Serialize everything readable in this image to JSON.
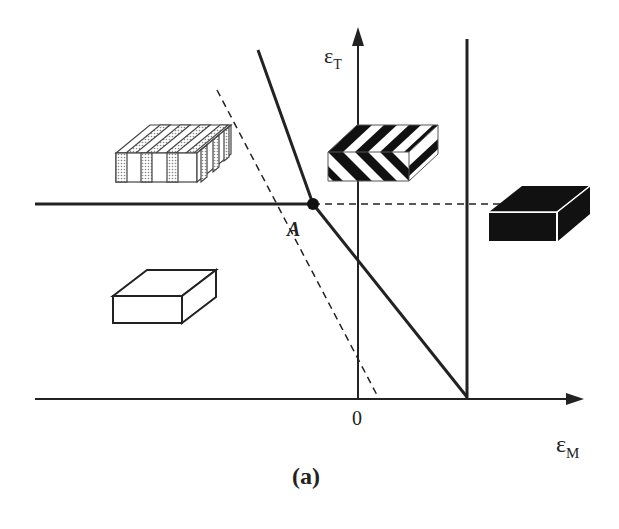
{
  "diagram": {
    "caption": "(a)",
    "axes": {
      "x_label_main": "ε",
      "x_label_sub": "M",
      "y_label_main": "ε",
      "y_label_sub": "T",
      "origin_label": "0"
    },
    "point": {
      "label": "A"
    },
    "blocks": [
      {
        "name": "striped-block",
        "description": "vertically striped block with dotted stripes",
        "position": "upper-left"
      },
      {
        "name": "chevron-block",
        "description": "black and white chevron-patterned block",
        "position": "upper-middle"
      },
      {
        "name": "black-block",
        "description": "solid black block",
        "position": "right"
      },
      {
        "name": "white-block",
        "description": "plain white block",
        "position": "lower-left"
      }
    ],
    "colors": {
      "line": "#222222",
      "background": "#ffffff",
      "stripe_fill": "#cccccc"
    }
  }
}
